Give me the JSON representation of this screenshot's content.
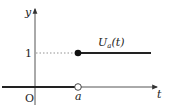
{
  "diagram": {
    "axes": {
      "x_label": "t",
      "y_label": "y",
      "origin_label": "O"
    },
    "ticks": {
      "x_tick_label": "a",
      "y_tick_label": "1"
    },
    "function_label": {
      "main": "U",
      "subscript": "a",
      "arg": "(t)"
    },
    "colors": {
      "line": "#222222",
      "axis": "#555555",
      "dotted": "#777777"
    }
  }
}
